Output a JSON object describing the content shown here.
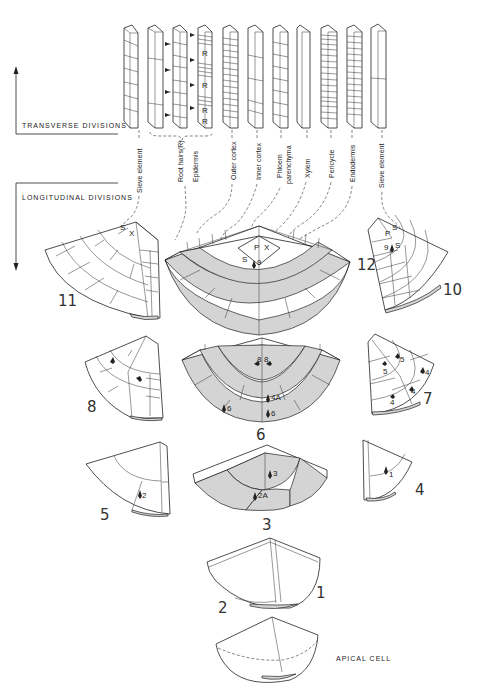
{
  "labels": {
    "transverse": "TRANSVERSE DIVISIONS",
    "longitudinal": "LONGITUDINAL DIVISIONS",
    "apical": "APICAL CELL"
  },
  "tissues": [
    "Sieve element",
    "Root hairs(R)",
    "Epidermis",
    "Outer cortex",
    "Inner cortex",
    "Phloem",
    "parenchyma",
    "Xylem",
    "Pericycle",
    "Endodermis",
    "Sieve element"
  ],
  "column_marker": "R",
  "stages": {
    "s1": "1",
    "s2": "2",
    "s3": "3",
    "s4": "4",
    "s5": "5",
    "s6": "6",
    "s7": "7",
    "s8": "8",
    "s9": "9",
    "s10": "10",
    "s11": "11",
    "s12": "12"
  },
  "cell_labels": {
    "S": "S",
    "X": "X",
    "P": "P",
    "n9": "9",
    "n1": "1",
    "n2": "2",
    "n2A": "2A",
    "n3": "3",
    "n4": "4",
    "n4A": "4A",
    "n5": "5",
    "n6": "6",
    "n8": "8"
  }
}
